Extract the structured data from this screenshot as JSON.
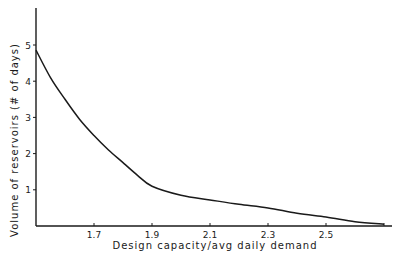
{
  "chart_data": {
    "type": "line",
    "title": "",
    "xlabel": "Design capacity/avg daily demand",
    "ylabel": "Volume of reservoirs (# of days)",
    "xlim": [
      1.5,
      2.74
    ],
    "ylim": [
      0,
      6
    ],
    "grid": false,
    "legend": null,
    "x_ticks": [
      {
        "value": 1.7,
        "label": "1.7"
      },
      {
        "value": 1.9,
        "label": "1.9"
      },
      {
        "value": 2.1,
        "label": "2.1"
      },
      {
        "value": 2.3,
        "label": "2.3"
      },
      {
        "value": 2.5,
        "label": "2.5"
      },
      {
        "value": 2.7,
        "label": ""
      }
    ],
    "y_ticks": [
      {
        "value": 1,
        "label": "1"
      },
      {
        "value": 2,
        "label": "2"
      },
      {
        "value": 3,
        "label": "3"
      },
      {
        "value": 4,
        "label": "4"
      },
      {
        "value": 5,
        "label": "5"
      }
    ],
    "series": [
      {
        "name": "Reservoir volume",
        "x": [
          1.5,
          1.55,
          1.6,
          1.65,
          1.7,
          1.75,
          1.8,
          1.85,
          1.9,
          2.0,
          2.1,
          2.2,
          2.3,
          2.4,
          2.5,
          2.6,
          2.7
        ],
        "values": [
          4.86,
          4.1,
          3.5,
          2.95,
          2.5,
          2.1,
          1.75,
          1.4,
          1.1,
          0.85,
          0.72,
          0.6,
          0.5,
          0.35,
          0.25,
          0.12,
          0.05
        ]
      }
    ]
  }
}
